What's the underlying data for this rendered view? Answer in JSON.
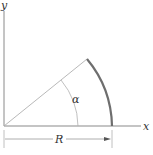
{
  "diagram": {
    "type": "circular-arc-geometry",
    "axes": {
      "x_label": "x",
      "y_label": "y"
    },
    "labels": {
      "angle": "α",
      "radius": "R"
    },
    "geometry": {
      "origin": [
        4,
        126
      ],
      "radius_px": 108,
      "angle_alpha_deg": 38,
      "arc_from_deg": 0,
      "arc_to_deg": 38
    },
    "colors": {
      "axis": "#8a8a8a",
      "arc": "#6e6e6e",
      "thin_line": "#b0b0b0",
      "text": "#333333",
      "background": "#ffffff"
    }
  }
}
